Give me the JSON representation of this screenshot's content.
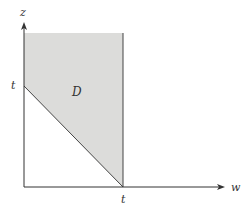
{
  "diagram": {
    "axes": {
      "vertical_label": "z",
      "horizontal_label": "w"
    },
    "ticks": {
      "z_tick": "t",
      "w_tick": "t"
    },
    "region": {
      "label": "D",
      "fill_color": "#dcdcda",
      "description": "Region bounded by z-axis, line w=t, and line w+z=t, extending upward"
    },
    "colors": {
      "axis": "#333333",
      "boundary": "#444444",
      "background": "#ffffff"
    }
  }
}
